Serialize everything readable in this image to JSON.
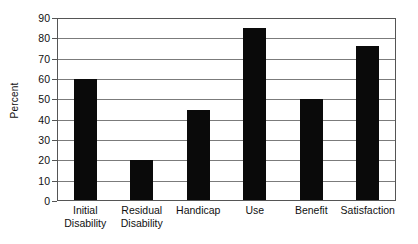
{
  "chart_data": {
    "type": "bar",
    "title": "",
    "subtitle": "",
    "xlabel": "",
    "ylabel": "Percent",
    "categories": [
      "Initial Disability",
      "Residual Disability",
      "Handicap",
      "Use",
      "Benefit",
      "Satisfaction"
    ],
    "category_lines": [
      [
        "Initial",
        "Disability"
      ],
      [
        "Residual",
        "Disability"
      ],
      [
        "Handicap",
        ""
      ],
      [
        "Use",
        ""
      ],
      [
        "Benefit",
        ""
      ],
      [
        "Satisfaction",
        ""
      ]
    ],
    "values": [
      60,
      20,
      45,
      85,
      50,
      76
    ],
    "ylim": [
      0,
      90
    ],
    "ytick_step": 10,
    "yticks": [
      90,
      80,
      70,
      60,
      50,
      40,
      30,
      20,
      10,
      0
    ],
    "ytick_labels": [
      "90",
      "80",
      "70",
      "60",
      "50",
      "40",
      "30",
      "20",
      "10",
      "0"
    ],
    "grid": true,
    "grid_axis": "y",
    "legend": false,
    "legend_position": "none",
    "bar_color": "#0a0a0a",
    "grid_color": "#7b7b7b",
    "axis_color": "#555555",
    "background_color": "#ffffff"
  }
}
